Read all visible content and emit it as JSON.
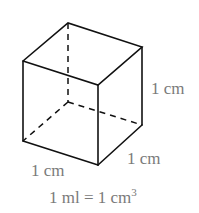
{
  "diagram": {
    "type": "cube-volume",
    "labels": {
      "height": "1 cm",
      "depth": "1 cm",
      "width": "1 cm",
      "equation_lhs": "1 ml = 1 cm",
      "equation_exp": "3"
    },
    "colors": {
      "edge": "#111111",
      "label": "#7a7a7a"
    }
  }
}
